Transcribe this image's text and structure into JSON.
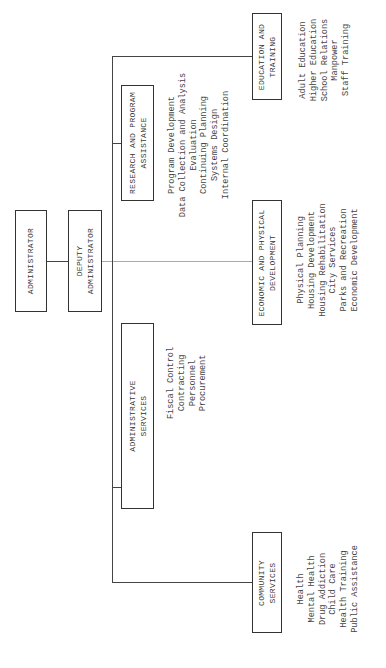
{
  "chart": {
    "orientation": "rotated-90-counterclockwise",
    "nodes": {
      "administrator": {
        "label": [
          "ADMINISTRATOR"
        ]
      },
      "deputy": {
        "label": [
          "DEPUTY",
          "ADMINISTRATOR"
        ]
      },
      "education": {
        "label": [
          "EDUCATION AND",
          "TRAINING"
        ],
        "items": [
          "Adult Education",
          "Higher Education",
          "School Relations",
          "Manpower",
          "Staff Training"
        ]
      },
      "research": {
        "label": [
          "RESEARCH AND PROGRAM",
          "ASSISTANCE"
        ],
        "items": [
          "Program Development",
          "Data Collection and Analysis",
          "Evaluation",
          "Continuing Planning",
          "Systems Design",
          "Internal Coordination"
        ]
      },
      "economic": {
        "label": [
          "ECONOMIC AND PHYSICAL",
          "DEVELOPMENT"
        ],
        "items": [
          "Physical Planning",
          "Housing Development",
          "Housing Rehabilitation",
          "City Services",
          "Parks and Recreation",
          "Economic Development"
        ]
      },
      "admin_services": {
        "label": [
          "ADMINISTRATIVE",
          "SERVICES"
        ],
        "items": [
          "Fiscal Control",
          "Contracting",
          "Personnel",
          "Procurement"
        ]
      },
      "community": {
        "label": [
          "COMMUNITY",
          "SERVICES"
        ],
        "items": [
          "Health",
          "Mental Health",
          "Drug Addiction",
          "Child Care",
          "Health Training",
          "Public Assistance"
        ]
      }
    }
  }
}
